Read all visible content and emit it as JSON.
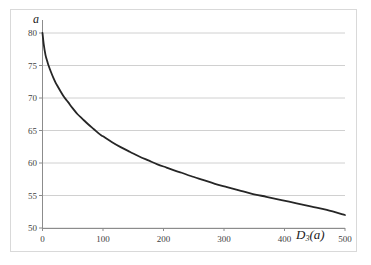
{
  "chart_data": {
    "type": "line",
    "title": "",
    "subtitle": "",
    "xlabel": "D_3(a)",
    "xlabel_base": "D",
    "xlabel_sub": "3",
    "xlabel_arg": "(a)",
    "ylabel": "a",
    "xlim": [
      0,
      500
    ],
    "ylim": [
      50,
      80
    ],
    "xticks": [
      0,
      100,
      200,
      300,
      400,
      500
    ],
    "xtick_labels": [
      "0",
      "100",
      "200",
      "300",
      "400",
      "500"
    ],
    "yticks": [
      50,
      55,
      60,
      65,
      70,
      75,
      80
    ],
    "ytick_labels": [
      "50",
      "55",
      "60",
      "65",
      "70",
      "75",
      "80"
    ],
    "grid": {
      "horizontal": true,
      "vertical": false,
      "color": "#d0d0d0"
    },
    "legend": {
      "visible": false,
      "position": "none"
    },
    "series": [
      {
        "name": "a vs D_3(a)",
        "color": "#262626",
        "line_width": 1.8,
        "x": [
          0,
          2,
          5,
          8,
          10,
          14,
          18,
          22,
          25,
          30,
          36,
          42,
          50,
          58,
          66,
          75,
          85,
          95,
          100,
          115,
          130,
          145,
          160,
          175,
          190,
          205,
          220,
          230,
          245,
          265,
          285,
          305,
          325,
          345,
          370,
          395,
          420,
          445,
          470,
          500
        ],
        "y": [
          80.0,
          78.3,
          76.6,
          75.6,
          75.0,
          74.0,
          73.1,
          72.3,
          71.8,
          71.0,
          70.1,
          69.4,
          68.4,
          67.5,
          66.8,
          66.0,
          65.2,
          64.4,
          64.1,
          63.2,
          62.4,
          61.7,
          61.0,
          60.4,
          59.8,
          59.3,
          58.8,
          58.5,
          58.0,
          57.4,
          56.8,
          56.3,
          55.8,
          55.3,
          54.8,
          54.3,
          53.8,
          53.3,
          52.8,
          52.0
        ]
      }
    ],
    "key_points": [
      {
        "x": 0,
        "y": 80
      },
      {
        "x": 10,
        "y": 75
      },
      {
        "x": 25,
        "y": 71.8
      },
      {
        "x": 50,
        "y": 68.4
      },
      {
        "x": 100,
        "y": 64.1
      },
      {
        "x": 230,
        "y": 58.5
      },
      {
        "x": 500,
        "y": 50
      }
    ],
    "axis_color": "#808080",
    "background": "#ffffff"
  },
  "frame": {
    "border_color": "#d9d9d9"
  }
}
